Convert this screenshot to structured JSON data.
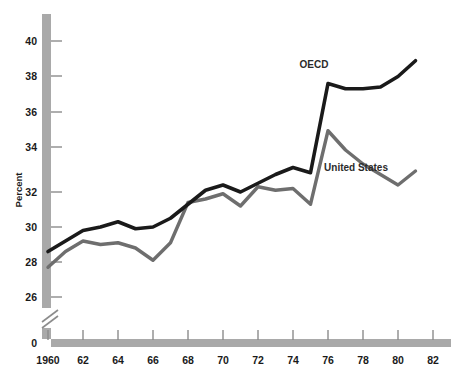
{
  "chart_data": {
    "type": "line",
    "title": "",
    "xlabel": "",
    "ylabel": "Percent",
    "xlim": [
      1960,
      1982.5
    ],
    "ylim": [
      26,
      41
    ],
    "grid": false,
    "legend_position": "inline-annotations",
    "y_axis_break": true,
    "y_break_note": "axis broken between 0 and 26",
    "x_ticks": [
      "1960",
      "62",
      "64",
      "66",
      "68",
      "70",
      "72",
      "74",
      "76",
      "78",
      "80",
      "82"
    ],
    "x_tick_values": [
      1960,
      1962,
      1964,
      1966,
      1968,
      1970,
      1972,
      1974,
      1976,
      1978,
      1980,
      1982
    ],
    "y_ticks": [
      "0",
      "26",
      "28",
      "30",
      "32",
      "34",
      "36",
      "38",
      "40"
    ],
    "y_tick_values": [
      0,
      26,
      28,
      30,
      32,
      34,
      36,
      38,
      40
    ],
    "x": [
      1960,
      1961,
      1962,
      1963,
      1964,
      1965,
      1966,
      1967,
      1968,
      1969,
      1970,
      1971,
      1972,
      1973,
      1974,
      1975,
      1976,
      1977,
      1978,
      1979,
      1980,
      1981
    ],
    "series": [
      {
        "name": "OECD",
        "color": "#1a1a1a",
        "label_x": 1975.2,
        "label_y": 39.1,
        "values": [
          28.6,
          29.2,
          29.8,
          30.0,
          30.3,
          29.9,
          30.0,
          30.5,
          31.3,
          32.1,
          32.4,
          32.0,
          32.5,
          33.0,
          33.4,
          33.1,
          38.2,
          37.9,
          37.9,
          38.0,
          38.6,
          39.5
        ]
      },
      {
        "name": "United States",
        "color": "#6e6e6e",
        "label_x": 1977.6,
        "label_y": 33.2,
        "values": [
          27.7,
          28.6,
          29.2,
          29.0,
          29.1,
          28.8,
          28.1,
          29.1,
          31.4,
          31.6,
          31.9,
          31.2,
          32.3,
          32.1,
          32.2,
          31.3,
          35.5,
          34.4,
          33.6,
          33.0,
          32.4,
          33.2
        ]
      }
    ]
  },
  "axis": {
    "y_title": "Percent"
  }
}
